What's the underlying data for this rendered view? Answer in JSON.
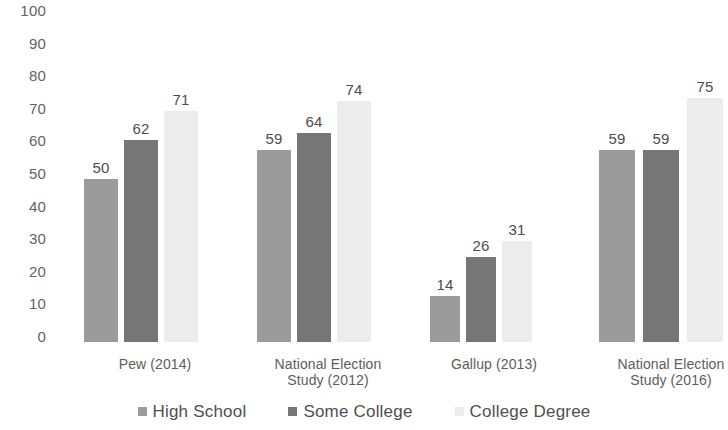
{
  "chart_data": {
    "type": "bar",
    "title": "",
    "subtitle": "",
    "xlabel": "",
    "ylabel": "",
    "ylim": [
      0,
      100
    ],
    "ytick_step": 10,
    "ytick_labels": [
      "100",
      "90",
      "80",
      "70",
      "60",
      "50",
      "40",
      "30",
      "20",
      "10",
      "0"
    ],
    "grid": false,
    "legend_position": "bottom",
    "show_data_labels": true,
    "categories": [
      "Pew (2014)",
      "National Election Study (2012)",
      "Gallup (2013)",
      "National Election Study (2016)"
    ],
    "category_lines": [
      [
        "Pew (2014)"
      ],
      [
        "National Election",
        "Study (2012)"
      ],
      [
        "Gallup (2013)"
      ],
      [
        "National Election",
        "Study (2016)"
      ]
    ],
    "series": [
      {
        "name": "High School",
        "color": "#9b9b9b",
        "values": [
          50,
          59,
          14,
          59
        ]
      },
      {
        "name": "Some College",
        "color": "#767676",
        "values": [
          62,
          64,
          26,
          59
        ]
      },
      {
        "name": "College Degree",
        "color": "#ececec",
        "values": [
          71,
          74,
          31,
          75
        ]
      }
    ]
  },
  "layout": {
    "groups": [
      {
        "left": 22,
        "width": 142,
        "bar_width": 34,
        "gap": 6,
        "label_left": 5,
        "label_width": 176
      },
      {
        "left": 195,
        "width": 142,
        "bar_width": 34,
        "gap": 6,
        "label_left": 178,
        "label_width": 176
      },
      {
        "left": 368,
        "width": 128,
        "bar_width": 30,
        "gap": 6,
        "label_left": 355,
        "label_width": 154
      },
      {
        "left": 537,
        "width": 148,
        "bar_width": 36,
        "gap": 8,
        "label_left": 520,
        "label_width": 178
      }
    ]
  }
}
